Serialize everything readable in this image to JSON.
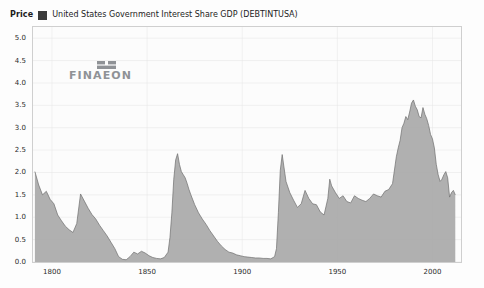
{
  "header": {
    "price_label": "Price",
    "legend_swatch_color": "#3a3a3a",
    "series_label": "United States Government Interest Share GDP (DEBTINTUSA)"
  },
  "logo": {
    "wordmark": "FINAEON"
  },
  "source_note": "Source: Global Financial Data",
  "colors": {
    "area_fill": "#a9a9a9",
    "area_stroke": "#6f6f6f",
    "plot_background": "#fcfcfc",
    "grid": "#e4e4e4",
    "frame": "#cfcfcf",
    "text": "#1c1c1c"
  },
  "chart_data": {
    "type": "area",
    "title": "United States Government Interest Share GDP (DEBTINTUSA)",
    "subtitle": "",
    "xlabel": "",
    "ylabel": "Price",
    "xlim": [
      1790,
      2015
    ],
    "ylim": [
      0.0,
      5.25
    ],
    "grid": true,
    "legend_position": "top-left",
    "xticks": [
      1800,
      1850,
      1900,
      1950,
      2000
    ],
    "xtick_labels": [
      "1800",
      "1850",
      "1900",
      "1950",
      "2000"
    ],
    "yticks": [
      0.0,
      0.5,
      1.0,
      1.5,
      2.0,
      2.5,
      3.0,
      3.5,
      4.0,
      4.5,
      5.0
    ],
    "ytick_labels": [
      "0.0",
      "0.5",
      "1.0",
      "1.5",
      "2.0",
      "2.5",
      "3.0",
      "3.5",
      "4.0",
      "4.5",
      "5.0"
    ],
    "series": [
      {
        "name": "United States Government Interest Share GDP (DEBTINTUSA)",
        "x": [
          1791,
          1793,
          1795,
          1797,
          1799,
          1801,
          1803,
          1805,
          1807,
          1809,
          1811,
          1813,
          1815,
          1817,
          1819,
          1821,
          1823,
          1825,
          1827,
          1829,
          1831,
          1833,
          1835,
          1837,
          1839,
          1841,
          1843,
          1845,
          1847,
          1849,
          1851,
          1853,
          1855,
          1857,
          1859,
          1861,
          1862,
          1863,
          1864,
          1865,
          1866,
          1867,
          1868,
          1869,
          1870,
          1871,
          1872,
          1873,
          1875,
          1877,
          1879,
          1881,
          1883,
          1885,
          1887,
          1889,
          1891,
          1893,
          1895,
          1897,
          1899,
          1901,
          1903,
          1905,
          1907,
          1909,
          1911,
          1913,
          1915,
          1917,
          1918,
          1919,
          1920,
          1921,
          1922,
          1923,
          1925,
          1927,
          1929,
          1931,
          1933,
          1935,
          1937,
          1939,
          1941,
          1943,
          1945,
          1946,
          1947,
          1949,
          1951,
          1953,
          1955,
          1957,
          1959,
          1961,
          1963,
          1965,
          1967,
          1969,
          1971,
          1973,
          1975,
          1977,
          1979,
          1981,
          1982,
          1983,
          1984,
          1985,
          1986,
          1987,
          1988,
          1989,
          1990,
          1991,
          1992,
          1993,
          1994,
          1995,
          1996,
          1997,
          1998,
          1999,
          2000,
          2001,
          2002,
          2003,
          2004,
          2005,
          2006,
          2007,
          2008,
          2009,
          2010,
          2011,
          2012
        ],
        "y": [
          2.02,
          1.72,
          1.5,
          1.58,
          1.4,
          1.3,
          1.05,
          0.92,
          0.8,
          0.72,
          0.66,
          0.86,
          1.52,
          1.36,
          1.2,
          1.06,
          0.96,
          0.82,
          0.7,
          0.58,
          0.44,
          0.3,
          0.12,
          0.06,
          0.05,
          0.12,
          0.22,
          0.18,
          0.24,
          0.2,
          0.14,
          0.1,
          0.08,
          0.07,
          0.1,
          0.22,
          0.55,
          1.1,
          1.85,
          2.28,
          2.42,
          2.18,
          2.02,
          1.95,
          1.88,
          1.76,
          1.62,
          1.5,
          1.28,
          1.1,
          0.96,
          0.84,
          0.7,
          0.58,
          0.46,
          0.36,
          0.28,
          0.22,
          0.2,
          0.16,
          0.14,
          0.12,
          0.11,
          0.1,
          0.09,
          0.09,
          0.08,
          0.08,
          0.07,
          0.12,
          0.3,
          1.1,
          2.05,
          2.4,
          2.1,
          1.8,
          1.55,
          1.38,
          1.22,
          1.3,
          1.6,
          1.42,
          1.3,
          1.28,
          1.12,
          1.05,
          1.42,
          1.85,
          1.7,
          1.55,
          1.42,
          1.48,
          1.35,
          1.32,
          1.48,
          1.42,
          1.38,
          1.35,
          1.42,
          1.52,
          1.48,
          1.45,
          1.58,
          1.62,
          1.75,
          2.35,
          2.55,
          2.72,
          3.0,
          3.1,
          3.25,
          3.18,
          3.35,
          3.55,
          3.62,
          3.48,
          3.4,
          3.25,
          3.22,
          3.45,
          3.3,
          3.2,
          3.05,
          2.85,
          2.75,
          2.55,
          2.18,
          1.95,
          1.8,
          1.85,
          1.95,
          2.02,
          1.88,
          1.45,
          1.55,
          1.6,
          1.5
        ],
        "detail_note": "Sharp Civil War peak ~2.4 near 1866, WWI peak ~2.4 near 1921, sustained 1980s-1990s high near 5.0, declining to ~1.5 by 2012",
        "min": 0.05,
        "max": 5.08,
        "max_year": 1991,
        "first_value": 2.02,
        "last_value": 1.5
      }
    ]
  }
}
